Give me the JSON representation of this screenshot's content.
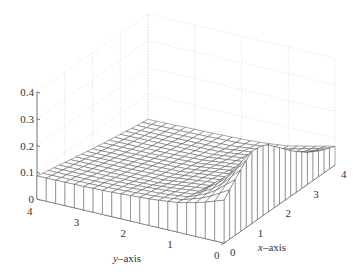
{
  "chart_data": {
    "type": "surface",
    "title": "",
    "xlabel": "x–axis",
    "ylabel": "y–axis",
    "zlabel": "",
    "xlim": [
      0,
      4
    ],
    "ylim": [
      0,
      4
    ],
    "zlim": [
      0,
      0.4
    ],
    "x_ticks": [
      "0",
      "1",
      "2",
      "3",
      "4"
    ],
    "y_ticks": [
      "0",
      "1",
      "2",
      "3",
      "4"
    ],
    "z_ticks": [
      "0",
      "0.1",
      "0.2",
      "0.3",
      "0.4"
    ],
    "grid": true,
    "legend": null,
    "mesh_style": "white faces, dark gray edges",
    "sample_x": [
      0,
      0.5,
      1,
      1.5,
      2,
      2.5,
      3,
      3.5,
      4
    ],
    "sample_y": [
      0,
      0.5,
      1,
      1.5,
      2,
      2.5,
      3,
      3.5,
      4
    ],
    "z": [
      [
        0.16,
        0.22,
        0.27,
        0.26,
        0.21,
        0.16,
        0.12,
        0.09,
        0.07
      ],
      [
        0.13,
        0.14,
        0.16,
        0.15,
        0.13,
        0.1,
        0.08,
        0.06,
        0.05
      ],
      [
        0.11,
        0.1,
        0.09,
        0.08,
        0.07,
        0.06,
        0.05,
        0.04,
        0.03
      ],
      [
        0.1,
        0.09,
        0.08,
        0.07,
        0.06,
        0.05,
        0.04,
        0.03,
        0.02
      ],
      [
        0.095,
        0.085,
        0.07,
        0.06,
        0.05,
        0.04,
        0.03,
        0.02,
        0.015
      ],
      [
        0.09,
        0.08,
        0.068,
        0.057,
        0.046,
        0.036,
        0.027,
        0.018,
        0.012
      ],
      [
        0.088,
        0.077,
        0.066,
        0.055,
        0.044,
        0.034,
        0.025,
        0.016,
        0.01
      ],
      [
        0.087,
        0.076,
        0.065,
        0.054,
        0.043,
        0.033,
        0.024,
        0.015,
        0.008
      ],
      [
        0.086,
        0.075,
        0.064,
        0.053,
        0.042,
        0.032,
        0.023,
        0.014,
        0.006
      ]
    ]
  },
  "projection": {
    "origin": [
      224,
      243
    ],
    "ex": [
      27.75,
      -19.5
    ],
    "ey": [
      -46.75,
      -11
    ],
    "ez_per_unit": -267.5
  },
  "mesh_resolution": 20
}
